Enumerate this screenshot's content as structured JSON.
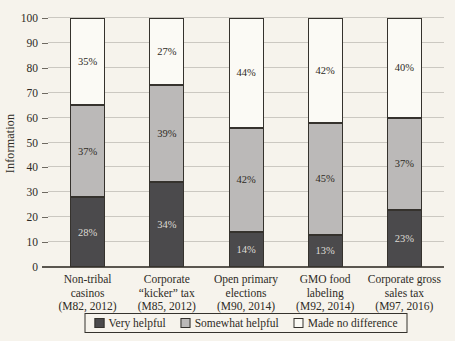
{
  "chart_data": {
    "type": "bar",
    "stacked": true,
    "title": "",
    "xlabel": "",
    "ylabel": "Information",
    "ylim": [
      0,
      100
    ],
    "yticks": [
      0,
      10,
      20,
      30,
      40,
      50,
      60,
      70,
      80,
      90,
      100
    ],
    "grid": true,
    "legend_position": "bottom",
    "value_suffix": "%",
    "categories": [
      {
        "label": "Non-tribal casinos (M82, 2012)",
        "lines": [
          "Non-tribal",
          "casinos",
          "(M82, 2012)"
        ]
      },
      {
        "label": "Corporate “kicker” tax (M85, 2012)",
        "lines": [
          "Corporate",
          "“kicker” tax",
          "(M85, 2012)"
        ]
      },
      {
        "label": "Open primary elections (M90, 2014)",
        "lines": [
          "Open primary",
          "elections",
          "(M90, 2014)"
        ]
      },
      {
        "label": "GMO food labeling (M92, 2014)",
        "lines": [
          "GMO food",
          "labeling",
          "(M92, 2014)"
        ]
      },
      {
        "label": "Corporate gross sales tax (M97, 2016)",
        "lines": [
          "Corporate gross",
          "sales tax",
          "(M97, 2016)"
        ]
      }
    ],
    "series": [
      {
        "name": "Very helpful",
        "color": "#4b4a4c",
        "label_color": "#dedbd5",
        "values": [
          28,
          34,
          14,
          13,
          23
        ]
      },
      {
        "name": "Somewhat helpful",
        "color": "#bbb9b8",
        "label_color": "#2e2b25",
        "values": [
          37,
          39,
          42,
          45,
          37
        ]
      },
      {
        "name": "Made no difference",
        "color": "#fbfaf5",
        "label_color": "#2e2b25",
        "values": [
          35,
          27,
          44,
          42,
          40
        ]
      }
    ]
  },
  "colors": {
    "paper": "#f6f3ec",
    "gridline": "#cbc8c1",
    "axis": "#5a564f",
    "text": "#2e2b25",
    "bar_border": "#35322d"
  }
}
